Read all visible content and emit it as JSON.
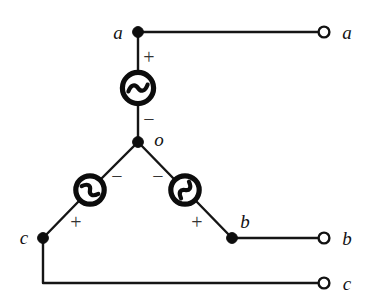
{
  "figure": {
    "kind": "circuit-schematic",
    "background_color": "#ffffff",
    "wire_color": "#151515",
    "symbol_color": "#0c0c0c",
    "label_color": "#121212",
    "sign_color": "#333333"
  },
  "nodes": [
    {
      "id": "node-a",
      "label": "a",
      "x": 138,
      "y": 32,
      "label_x": 118,
      "label_y": 32,
      "filled": true
    },
    {
      "id": "node-o",
      "label": "o",
      "x": 138,
      "y": 142,
      "label_x": 159,
      "label_y": 139,
      "filled": true
    },
    {
      "id": "node-c",
      "label": "c",
      "x": 43,
      "y": 238,
      "label_x": 24,
      "label_y": 237,
      "filled": true
    },
    {
      "id": "node-b",
      "label": "b",
      "x": 232,
      "y": 238,
      "label_x": 245,
      "label_y": 221,
      "filled": true
    }
  ],
  "terminals": [
    {
      "id": "terminal-a",
      "label": "a",
      "x": 324,
      "y": 32,
      "label_x": 346,
      "label_y": 32
    },
    {
      "id": "terminal-b",
      "label": "b",
      "x": 324,
      "y": 238,
      "label_x": 346,
      "label_y": 238
    },
    {
      "id": "terminal-c",
      "label": "c",
      "x": 324,
      "y": 283,
      "label_x": 346,
      "label_y": 283
    }
  ],
  "sources": [
    {
      "id": "source-phase-a",
      "icon": "ac-source-icon",
      "center_x": 138,
      "center_y": 88,
      "radius": 18,
      "orientation_deg": 0,
      "between": [
        "node-a",
        "node-o"
      ],
      "polarity": [
        {
          "sign": "+",
          "x": 149,
          "y": 57
        },
        {
          "sign": "−",
          "x": 149,
          "y": 119
        }
      ]
    },
    {
      "id": "source-phase-c",
      "icon": "ac-source-icon",
      "center_x": 90,
      "center_y": 190,
      "radius": 16,
      "orientation_deg": 45,
      "between": [
        "node-o",
        "node-c"
      ],
      "polarity": [
        {
          "sign": "−",
          "x": 117,
          "y": 176
        },
        {
          "sign": "+",
          "x": 76,
          "y": 222
        }
      ]
    },
    {
      "id": "source-phase-b",
      "icon": "ac-source-icon",
      "center_x": 185,
      "center_y": 190,
      "radius": 16,
      "orientation_deg": -45,
      "between": [
        "node-o",
        "node-b"
      ],
      "polarity": [
        {
          "sign": "−",
          "x": 158,
          "y": 176
        },
        {
          "sign": "+",
          "x": 197,
          "y": 222
        }
      ]
    }
  ],
  "wires": [
    {
      "id": "wire-a-line",
      "path": "M 138 32 L 324 32"
    },
    {
      "id": "wire-a-source-top",
      "path": "M 138 32 L 138 70"
    },
    {
      "id": "wire-a-source-bottom",
      "path": "M 138 106 L 138 142"
    },
    {
      "id": "wire-o-to-source-c",
      "path": "M 138 142 L 101 179"
    },
    {
      "id": "wire-source-c-to-c",
      "path": "M 79 201 L 43 238"
    },
    {
      "id": "wire-o-to-source-b",
      "path": "M 138 142 L 174 179"
    },
    {
      "id": "wire-source-b-to-b",
      "path": "M 196 201 L 232 238"
    },
    {
      "id": "wire-b-line",
      "path": "M 232 238 L 324 238"
    },
    {
      "id": "wire-c-line",
      "path": "M 43 238 L 43 283 L 324 283"
    }
  ],
  "labels": {
    "node_a": "a",
    "node_o": "o",
    "node_b": "b",
    "node_c": "c",
    "terminal_a": "a",
    "terminal_b": "b",
    "terminal_c": "c",
    "plus": "+",
    "minus": "−"
  }
}
